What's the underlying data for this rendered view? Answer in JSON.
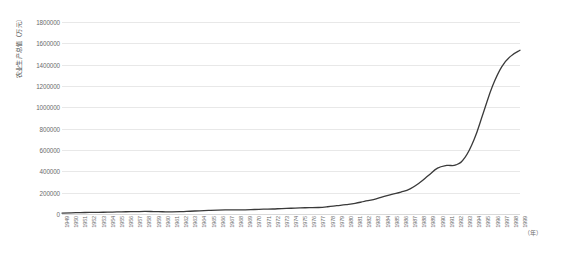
{
  "chart_data": {
    "type": "line",
    "title": "",
    "xlabel": "（年）",
    "ylabel": "农业生产总值（万元）",
    "ylim": [
      0,
      1800000
    ],
    "ytick_labels": [
      "1800000",
      "1600000",
      "1400000",
      "1200000",
      "1000000",
      "800000",
      "600000",
      "400000",
      "200000",
      "0"
    ],
    "ytick_values": [
      1800000,
      1600000,
      1400000,
      1200000,
      1000000,
      800000,
      600000,
      400000,
      200000,
      0
    ],
    "grid": "horizontal",
    "legend": "none",
    "line_color": "#3a3a3a",
    "categories": [
      "1949",
      "1950",
      "1951",
      "1952",
      "1953",
      "1954",
      "1955",
      "1956",
      "1957",
      "1958",
      "1959",
      "1960",
      "1961",
      "1962",
      "1963",
      "1964",
      "1965",
      "1966",
      "1967",
      "1968",
      "1969",
      "1970",
      "1971",
      "1972",
      "1973",
      "1974",
      "1975",
      "1976",
      "1977",
      "1978",
      "1979",
      "1980",
      "1981",
      "1982",
      "1983",
      "1984",
      "1985",
      "1986",
      "1987",
      "1988",
      "1989",
      "1990",
      "1991",
      "1992",
      "1993",
      "1994",
      "1995",
      "1996",
      "1997",
      "1998",
      "1999"
    ],
    "values": [
      9000,
      11000,
      13000,
      15000,
      16000,
      17000,
      19000,
      21000,
      22000,
      24000,
      23000,
      21000,
      20000,
      22000,
      26000,
      30000,
      34000,
      37000,
      38000,
      38000,
      39000,
      42000,
      45000,
      47000,
      51000,
      54000,
      58000,
      59000,
      61000,
      68000,
      78000,
      88000,
      100000,
      118000,
      135000,
      160000,
      185000,
      205000,
      235000,
      290000,
      360000,
      430000,
      455000,
      460000,
      530000,
      700000,
      950000,
      1200000,
      1380000,
      1480000,
      1535000
    ]
  },
  "axis": {
    "y_title": "农业生产总值（万元）",
    "x_unit": "（年）"
  }
}
